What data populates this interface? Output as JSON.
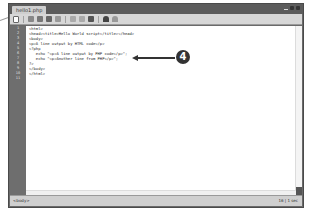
{
  "window": {
    "tab_title": "hello1.php",
    "controls": [
      "minimize",
      "maximize",
      "close"
    ]
  },
  "toolbar": {
    "icons": [
      "new-file-icon",
      "open-icon",
      "save-icon",
      "save-all-icon",
      "print-icon",
      "cut-icon",
      "copy-icon",
      "paste-icon",
      "undo-icon",
      "redo-icon"
    ]
  },
  "editor": {
    "line_numbers": [
      "1",
      "2",
      "3",
      "4",
      "5",
      "6",
      "7",
      "8",
      "9",
      "10",
      "11"
    ],
    "lines": [
      "<html>",
      "<head><title>Hello World script</title></head>",
      "<body>",
      "<p>A line output by HTML code</p>",
      "<?php",
      "   echo \"<p>A line output by PHP code</p>\";",
      "   echo \"<p>Another line from PHP</p>\";",
      "?>",
      "</body>",
      "</html>",
      ""
    ]
  },
  "callout": {
    "number": "4"
  },
  "statusbar": {
    "tag": "<body>",
    "info": "16 | 1 sec"
  }
}
